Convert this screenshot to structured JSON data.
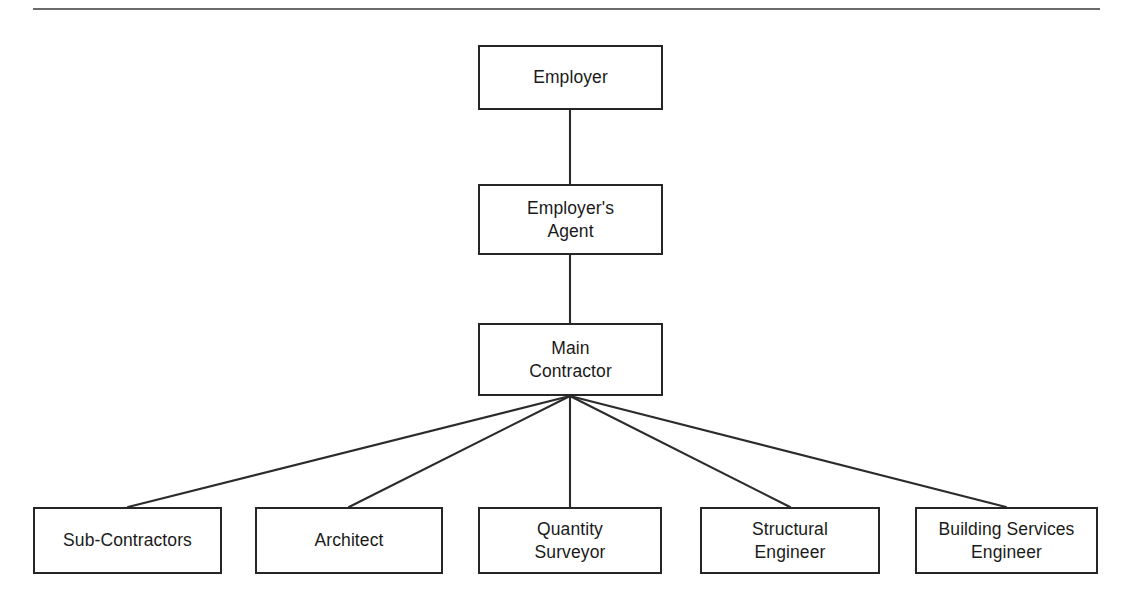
{
  "diagram": {
    "type": "organisation-chart",
    "divider": {
      "name": "top-horizontal-rule",
      "x1": 33,
      "y1": 9,
      "x2": 1100,
      "y2": 9
    },
    "nodes": [
      {
        "id": "employer",
        "label": "Employer",
        "level": 1,
        "x": 478,
        "y": 45,
        "w": 185,
        "h": 65
      },
      {
        "id": "employers-agent",
        "label": "Employer's\nAgent",
        "level": 2,
        "x": 478,
        "y": 184,
        "w": 185,
        "h": 71
      },
      {
        "id": "main-contractor",
        "label": "Main\nContractor",
        "level": 3,
        "x": 478,
        "y": 323,
        "w": 185,
        "h": 73
      },
      {
        "id": "sub-contractors",
        "label": "Sub-Contractors",
        "level": 4,
        "x": 33,
        "y": 507,
        "w": 189,
        "h": 67
      },
      {
        "id": "architect",
        "label": "Architect",
        "level": 4,
        "x": 255,
        "y": 507,
        "w": 188,
        "h": 67
      },
      {
        "id": "quantity-surveyor",
        "label": "Quantity\nSurveyor",
        "level": 4,
        "x": 478,
        "y": 507,
        "w": 184,
        "h": 67
      },
      {
        "id": "structural-engineer",
        "label": "Structural\nEngineer",
        "level": 4,
        "x": 700,
        "y": 507,
        "w": 180,
        "h": 67
      },
      {
        "id": "building-services-engineer",
        "label": "Building Services\nEngineer",
        "level": 4,
        "x": 915,
        "y": 507,
        "w": 183,
        "h": 67
      }
    ],
    "connectors": [
      {
        "name": "employer-to-employers-agent",
        "from": "employer",
        "to": "employers-agent",
        "x1": 570,
        "y1": 110,
        "x2": 570,
        "y2": 184
      },
      {
        "name": "employers-agent-to-main-contractor",
        "from": "employers-agent",
        "to": "main-contractor",
        "x1": 570,
        "y1": 255,
        "x2": 570,
        "y2": 323
      },
      {
        "name": "main-contractor-to-sub-contractors",
        "from": "main-contractor",
        "to": "sub-contractors",
        "x1": 570,
        "y1": 396,
        "x2": 128,
        "y2": 507
      },
      {
        "name": "main-contractor-to-architect",
        "from": "main-contractor",
        "to": "architect",
        "x1": 570,
        "y1": 396,
        "x2": 349,
        "y2": 507
      },
      {
        "name": "main-contractor-to-quantity-surveyor",
        "from": "main-contractor",
        "to": "quantity-surveyor",
        "x1": 570,
        "y1": 396,
        "x2": 570,
        "y2": 507
      },
      {
        "name": "main-contractor-to-structural-engineer",
        "from": "main-contractor",
        "to": "structural-engineer",
        "x1": 570,
        "y1": 396,
        "x2": 790,
        "y2": 507
      },
      {
        "name": "main-contractor-to-building-services-engineer",
        "from": "main-contractor",
        "to": "building-services-engineer",
        "x1": 570,
        "y1": 396,
        "x2": 1006,
        "y2": 507
      }
    ],
    "colors": {
      "box_border": "#262626",
      "box_fill": "#ffffff",
      "connector": "#2b2b2b",
      "rule": "#3a3a3a",
      "text": "#1a1a1a",
      "page_background": "#ffffff"
    }
  }
}
